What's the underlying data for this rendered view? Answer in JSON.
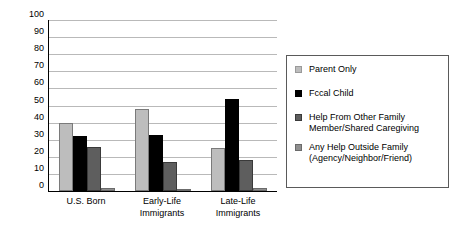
{
  "chart_data": {
    "type": "bar",
    "title": "",
    "subtitle": "",
    "xlabel": "",
    "ylabel": "",
    "ylim": [
      0,
      100
    ],
    "ytick_step": 10,
    "yticks": [
      "100",
      "90",
      "80",
      "70",
      "60",
      "50",
      "40",
      "30",
      "20",
      "10",
      "0"
    ],
    "grid": true,
    "legend_position": "right",
    "categories": [
      "U.S. Born",
      "Early-Life\nImmigrants",
      "Late-Life\nImmigrants"
    ],
    "category_labels": [
      {
        "line1": "U.S. Born",
        "line2": ""
      },
      {
        "line1": "Early-Life",
        "line2": "Immigrants"
      },
      {
        "line1": "Late-Life",
        "line2": "Immigrants"
      }
    ],
    "series": [
      {
        "name": "Parent Only",
        "color": "#bdbdbd",
        "values": [
          40,
          48,
          25
        ]
      },
      {
        "name": "Fccal Child",
        "color": "#000000",
        "values": [
          32,
          33,
          54
        ]
      },
      {
        "name": "Help From Other Family\nMember/Shared Caregiving",
        "color": "#5e5e5e",
        "values": [
          26,
          17,
          18
        ]
      },
      {
        "name": "Any Help Outside Family\n(Agency/Neighbor/Friend)",
        "color": "#8f8f8f",
        "values": [
          2,
          1,
          2
        ]
      }
    ]
  },
  "legend": {
    "items": [
      {
        "label": "Parent Only"
      },
      {
        "label": "Fccal Child"
      },
      {
        "label": "Help From Other Family\nMember/Shared Caregiving"
      },
      {
        "label": "Any Help Outside Family\n(Agency/Neighbor/Friend)"
      }
    ]
  }
}
